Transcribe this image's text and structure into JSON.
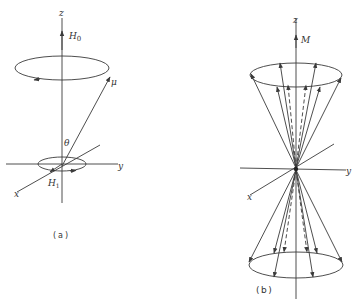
{
  "figure": {
    "panel_a": {
      "caption": "(a)",
      "labels": {
        "z_axis": "z",
        "y_axis": "y",
        "x_axis": "x",
        "static_field": "H",
        "static_field_sub": "0",
        "rf_field": "H",
        "rf_field_sub": "1",
        "magnetic_moment": "μ",
        "angle": "θ"
      }
    },
    "panel_b": {
      "caption": "(b)",
      "labels": {
        "z_axis": "z",
        "y_axis": "y",
        "x_axis": "x",
        "magnetization": "M"
      }
    },
    "colors": {
      "line": "#3a3a3a",
      "background": "#ffffff"
    }
  }
}
